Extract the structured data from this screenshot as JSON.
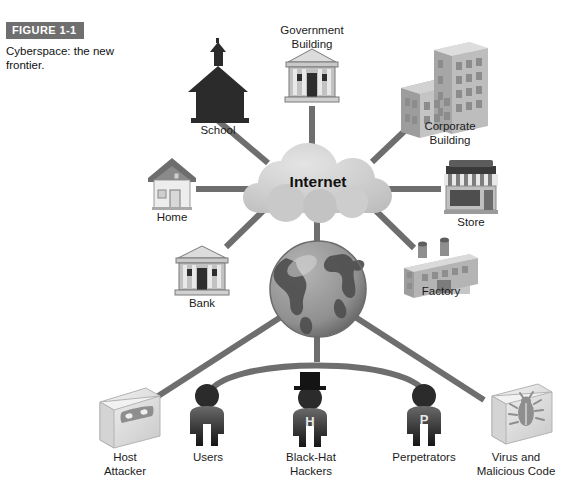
{
  "figure": {
    "tag": "FIGURE 1-1",
    "caption": "Cyberspace:\nthe new frontier."
  },
  "diagram": {
    "center_cloud": {
      "label": "Internet",
      "icon": "cloud-icon"
    },
    "center_globe": {
      "label": "",
      "icon": "globe-icon"
    },
    "top_nodes": [
      {
        "id": "school",
        "label": "School",
        "icon": "school-building-icon"
      },
      {
        "id": "government-building",
        "label": "Government\nBuilding",
        "icon": "government-building-icon"
      },
      {
        "id": "corporate-building",
        "label": "Corporate\nBuilding",
        "icon": "corporate-building-icon"
      },
      {
        "id": "store",
        "label": "Store",
        "icon": "store-icon"
      },
      {
        "id": "factory",
        "label": "Factory",
        "icon": "factory-icon"
      },
      {
        "id": "bank",
        "label": "Bank",
        "icon": "bank-building-icon"
      },
      {
        "id": "home",
        "label": "Home",
        "icon": "house-icon"
      }
    ],
    "bottom_nodes": [
      {
        "id": "host-attacker",
        "label": "Host\nAttacker",
        "icon": "masked-box-icon",
        "badge": ""
      },
      {
        "id": "users",
        "label": "Users",
        "icon": "person-icon",
        "badge": ""
      },
      {
        "id": "black-hat-hackers",
        "label": "Black-Hat\nHackers",
        "icon": "person-tophat-icon",
        "badge": "H"
      },
      {
        "id": "perpetrators",
        "label": "Perpetrators",
        "icon": "person-icon",
        "badge": "P"
      },
      {
        "id": "virus",
        "label": "Virus and\nMalicious Code",
        "icon": "bug-box-icon",
        "badge": ""
      }
    ]
  },
  "colors": {
    "line": "#6e6e6e",
    "cloud_fill": "#d2d2d2",
    "globe_ocean": "#9a9a9a",
    "globe_land": "#5a5a5a",
    "dark_figure": "#2b2b2b",
    "light_box": "#e6e6e6",
    "text": "#1b1b1b",
    "tag_bg": "#6f6f6f"
  }
}
